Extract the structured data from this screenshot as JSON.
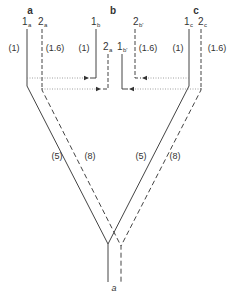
{
  "groups": [
    {
      "name": "a",
      "x": 30
    },
    {
      "name": "b",
      "x": 113
    },
    {
      "name": "c",
      "x": 196
    }
  ],
  "columns": {
    "a1": {
      "main": "1",
      "sub": "a",
      "ratio": "(1)"
    },
    "a2": {
      "main": "2",
      "sub": "a",
      "ratio": "(1.6)"
    },
    "b1": {
      "main": "1",
      "sub": "b",
      "ratio": "(1)"
    },
    "b2": {
      "main": "2",
      "sub": "a"
    },
    "b1p": {
      "main": "1",
      "sub": "b'"
    },
    "b2p": {
      "main": "2",
      "sub": "b'",
      "ratio": "(1.6)"
    },
    "c1": {
      "main": "1",
      "sub": "c",
      "ratio": "(1)"
    },
    "c2": {
      "main": "2",
      "sub": "c",
      "ratio": "(1.6)"
    }
  },
  "branches": {
    "left_solid": "(5)",
    "left_dashed": "(8)",
    "right_solid": "(5)",
    "right_dashed": "(8)"
  },
  "output_label": "a",
  "colors": {
    "line": "#444444",
    "dotted": "#888888",
    "text": "#333333"
  }
}
